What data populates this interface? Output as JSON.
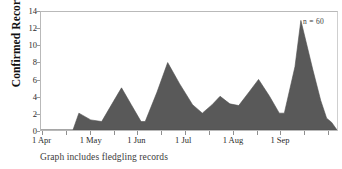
{
  "chart_data": {
    "type": "area",
    "title": "",
    "xlabel": "",
    "ylabel": "Confirmed Records",
    "ylim": [
      0,
      14
    ],
    "yticks": [
      0,
      2,
      4,
      6,
      8,
      10,
      12,
      14
    ],
    "xtick_labels": [
      "1 Apr",
      "1 May",
      "1 Jun",
      "1 Jul",
      "1 Aug",
      "1 Sep"
    ],
    "grid": false,
    "legend": "none",
    "annotation": "n = 60",
    "caption": "Graph includes fledgling records",
    "series_color": "#595959",
    "series": [
      {
        "name": "Confirmed Records",
        "x": [
          "1 Apr",
          "8 Apr",
          "15 Apr",
          "22 Apr",
          "29 Apr",
          "1 May",
          "8 May",
          "15 May",
          "22 May",
          "29 May",
          "1 Jun",
          "8 Jun",
          "15 Jun",
          "22 Jun",
          "29 Jun",
          "1 Jul",
          "8 Jul",
          "15 Jul",
          "22 Jul",
          "29 Jul",
          "1 Aug",
          "8 Aug",
          "15 Aug",
          "22 Aug",
          "29 Aug",
          "1 Sep",
          "8 Sep",
          "15 Sep",
          "22 Sep",
          "30 Sep"
        ],
        "values": [
          0,
          0,
          0,
          0,
          0,
          2,
          1,
          1,
          5,
          3,
          1,
          4,
          8,
          6,
          4,
          2,
          3,
          4,
          3,
          3,
          6,
          4,
          2,
          8,
          13,
          9,
          5,
          2,
          1,
          0
        ]
      }
    ],
    "points_normalized": [
      [
        0.0,
        0
      ],
      [
        0.055,
        0
      ],
      [
        0.108,
        0
      ],
      [
        0.128,
        2
      ],
      [
        0.168,
        1.2
      ],
      [
        0.205,
        1
      ],
      [
        0.245,
        3.4
      ],
      [
        0.272,
        5
      ],
      [
        0.305,
        3
      ],
      [
        0.338,
        1
      ],
      [
        0.352,
        1
      ],
      [
        0.392,
        4.5
      ],
      [
        0.428,
        8
      ],
      [
        0.468,
        5.5
      ],
      [
        0.512,
        3
      ],
      [
        0.545,
        2
      ],
      [
        0.578,
        3
      ],
      [
        0.605,
        4
      ],
      [
        0.638,
        3.1
      ],
      [
        0.668,
        2.9
      ],
      [
        0.705,
        4.6
      ],
      [
        0.735,
        6
      ],
      [
        0.772,
        4
      ],
      [
        0.805,
        2
      ],
      [
        0.822,
        2
      ],
      [
        0.858,
        7.5
      ],
      [
        0.878,
        13
      ],
      [
        0.918,
        7.2
      ],
      [
        0.945,
        3.5
      ],
      [
        0.965,
        1.4
      ],
      [
        0.982,
        0.9
      ],
      [
        1.0,
        0
      ]
    ]
  }
}
